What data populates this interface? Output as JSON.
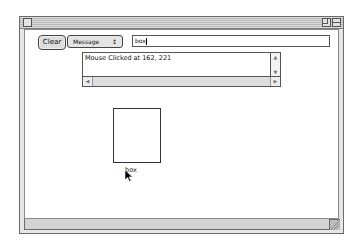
{
  "window": {
    "title": "",
    "controls": [
      "close-box",
      "zoom-box",
      "collapse-box"
    ]
  },
  "toolbar": {
    "clear_label": "Clear",
    "popup_selected": "Message",
    "popup_arrows": "↕",
    "text_field_value": "box"
  },
  "log": {
    "message": "Mouse Clicked at 162, 221",
    "scroll_up": "▲",
    "scroll_down": "▼",
    "scroll_left": "◀",
    "scroll_right": "▶"
  },
  "canvas": {
    "box_label": "box"
  }
}
